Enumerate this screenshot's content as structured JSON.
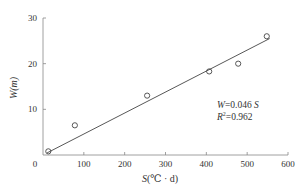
{
  "chart_data": {
    "type": "scatter",
    "title": "",
    "xlabel": "S(℃·d)",
    "ylabel": "W(m)",
    "xlim": [
      0,
      600
    ],
    "ylim": [
      0,
      30
    ],
    "x_ticks": [
      0,
      100,
      200,
      300,
      400,
      500,
      600
    ],
    "y_ticks": [
      0,
      10,
      20,
      30
    ],
    "grid": false,
    "legend": null,
    "series": [
      {
        "name": "observations",
        "marker": "open-circle",
        "x": [
          13,
          78,
          255,
          407,
          478,
          548
        ],
        "y": [
          0.8,
          6.5,
          13.0,
          18.3,
          20.0,
          26.0
        ]
      },
      {
        "name": "fit",
        "type": "line",
        "equation": "W=0.046 S",
        "slope": 0.046,
        "x": [
          10,
          555
        ],
        "y": [
          0.46,
          25.5
        ]
      }
    ],
    "annotations": [
      {
        "text": "W=0.046 S",
        "position": "lower-right"
      },
      {
        "text": "R²=0.962",
        "position": "lower-right"
      }
    ]
  },
  "labels": {
    "x_axis_title_var": "S",
    "x_axis_title_unit": "(℃ · d)",
    "y_axis_title": "W(m)",
    "eq_W": "W",
    "eq_rest": "=0.046 ",
    "eq_S": "S",
    "r2_R": "R",
    "r2_sup": "2",
    "r2_rest": "=0.962",
    "x_ticks": [
      "0",
      "100",
      "200",
      "300",
      "400",
      "500",
      "600"
    ],
    "y_ticks": [
      "10",
      "20",
      "30"
    ]
  }
}
